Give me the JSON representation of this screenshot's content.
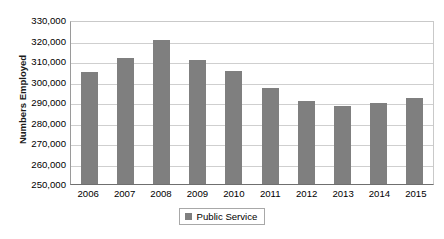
{
  "chart_data": {
    "type": "bar",
    "title": "",
    "xlabel": "",
    "ylabel": "Numbers Employed",
    "categories": [
      "2006",
      "2007",
      "2008",
      "2009",
      "2010",
      "2011",
      "2012",
      "2013",
      "2014",
      "2015"
    ],
    "series": [
      {
        "name": "Public Service",
        "color": "#7f7f7f",
        "values": [
          304600,
          311500,
          320200,
          310300,
          305200,
          296700,
          290500,
          288200,
          289600,
          292000
        ]
      }
    ],
    "ylim": [
      250000,
      330000
    ],
    "ytick_labels": [
      "330,000",
      "320,000",
      "310,000",
      "300,000",
      "290,000",
      "280,000",
      "270,000",
      "260,000",
      "250,000"
    ],
    "ytick_values": [
      330000,
      320000,
      310000,
      300000,
      290000,
      280000,
      270000,
      260000,
      250000
    ],
    "grid": true,
    "legend_position": "bottom"
  },
  "legend": {
    "entries": [
      {
        "label": "Public Service",
        "color": "#7f7f7f"
      }
    ]
  }
}
